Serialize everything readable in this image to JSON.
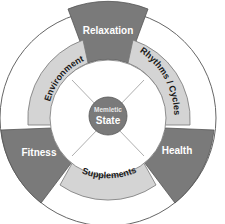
{
  "diagram": {
    "center": {
      "line1": "Memletic",
      "line2": "State"
    },
    "outer_segments": [
      {
        "label": "Relaxation",
        "position": "top"
      },
      {
        "label": "Health",
        "position": "lower-right"
      },
      {
        "label": "Fitness",
        "position": "lower-left"
      }
    ],
    "inner_segments": [
      {
        "label": "Rhythms / Cycles",
        "position": "upper-right"
      },
      {
        "label": "Supplements",
        "position": "bottom"
      },
      {
        "label": "Environment",
        "position": "upper-left"
      }
    ],
    "colors": {
      "outer_segment": "#7a7a7a",
      "inner_ring": "#d4d4d4",
      "center": "#7a7a7a",
      "stroke": "#555555",
      "background": "#ffffff"
    }
  }
}
